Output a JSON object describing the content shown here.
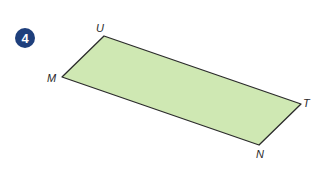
{
  "problem": {
    "number": "4",
    "badge_color": "#1e3f7c"
  },
  "shape": {
    "type": "parallelogram",
    "fill": "#cfe8b3",
    "stroke": "#2b2b2b",
    "vertices": [
      {
        "label": "U",
        "x": 104,
        "y": 36
      },
      {
        "label": "T",
        "x": 301,
        "y": 104
      },
      {
        "label": "N",
        "x": 259,
        "y": 145
      },
      {
        "label": "M",
        "x": 62,
        "y": 77
      }
    ]
  },
  "labels": {
    "U": "U",
    "T": "T",
    "N": "N",
    "M": "M"
  }
}
